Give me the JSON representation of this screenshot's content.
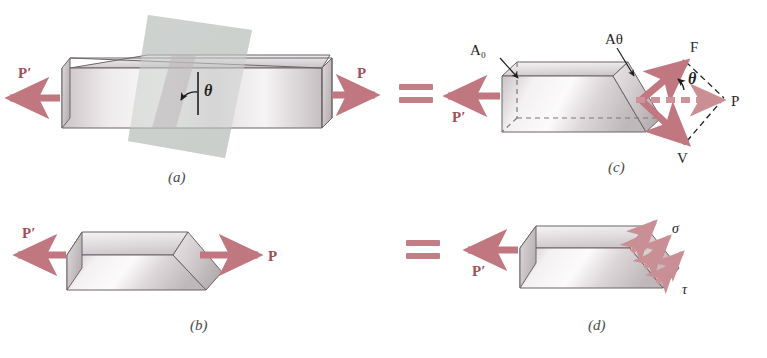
{
  "figure": {
    "background_color": "#ffffff",
    "force_color": "#c1777f",
    "force_label_color": "#9e4f57",
    "bar_fill_light": "#f2eff0",
    "bar_fill_mid": "#d8d4d6",
    "bar_fill_dark": "#b9b3b6",
    "outline_color": "#6b6468",
    "cut_plane_color": "#c9cdcb",
    "dash_color": "#1d1d1d"
  },
  "panels": [
    {
      "id": "a",
      "tag": "(a)",
      "description": "Prismatic bar in tension with an inclined cutting plane at angle theta",
      "labels": {
        "left_force": "P′",
        "right_force": "P",
        "angle": "θ"
      }
    },
    {
      "id": "b",
      "tag": "(b)",
      "description": "Free-body of the left portion after sectioning on the inclined plane",
      "labels": {
        "left_force": "P′",
        "right_force": "P"
      }
    },
    {
      "id": "c",
      "tag": "(c)",
      "description": "Resultant P resolved into normal force F and shear force V on the inclined face",
      "labels": {
        "left_force": "P′",
        "resultant_force": "P",
        "normal_force": "F",
        "shear_force": "V",
        "angle": "θ",
        "area_normal": "A₀",
        "area_inclined": "Aθ",
        "area_normal_sub": "0",
        "area_inclined_sub": "θ",
        "area_base": "A"
      }
    },
    {
      "id": "d",
      "tag": "(d)",
      "description": "Normal stress sigma and shear stress tau distributed over the inclined face",
      "labels": {
        "left_force": "P′",
        "normal_stress": "σ",
        "shear_stress": "τ"
      }
    }
  ],
  "equals_signs": [
    {
      "id": "equals-top",
      "symbol": "="
    },
    {
      "id": "equals-bottom",
      "symbol": "="
    }
  ]
}
